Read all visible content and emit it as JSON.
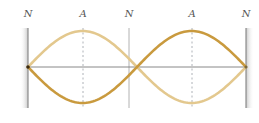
{
  "diagram": {
    "labels": [
      {
        "text": "N",
        "x": 28,
        "kind": "node"
      },
      {
        "text": "A",
        "x": 83,
        "kind": "antinode"
      },
      {
        "text": "N",
        "x": 129,
        "kind": "node"
      },
      {
        "text": "A",
        "x": 192,
        "kind": "antinode"
      },
      {
        "text": "N",
        "x": 246,
        "kind": "node"
      }
    ],
    "geometry": {
      "left_wall_x": 28,
      "right_wall_x": 246,
      "axis_y": 67,
      "amplitude_px": 36,
      "wall_top": 28,
      "wall_bottom": 108
    },
    "colors": {
      "curve_light": "#e3c88e",
      "curve_dark": "#c99a3e",
      "axis": "#7a7a7a",
      "wall": "#9a9a9a",
      "dashed": "#9aa0a6",
      "label": "#555555"
    }
  }
}
